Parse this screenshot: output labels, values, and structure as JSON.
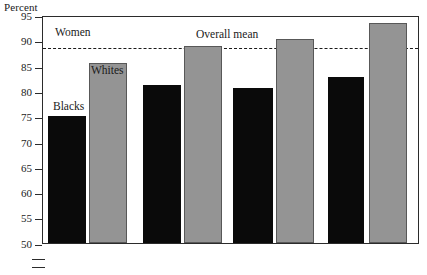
{
  "chart_data": {
    "type": "bar",
    "title": "",
    "ylabel": "Percent",
    "xlabel": "",
    "ylim": [
      50,
      95
    ],
    "ytick_values": [
      50,
      55,
      60,
      65,
      70,
      75,
      80,
      85,
      90,
      95
    ],
    "ytick_labels": [
      "50",
      "55",
      "60",
      "65",
      "70",
      "75",
      "80",
      "85",
      "90",
      "95"
    ],
    "axis_break_below": 50,
    "grid": false,
    "legend_position": "in-plot annotations",
    "categories": [
      "Group 1",
      "Group 2",
      "Group 3",
      "Group 4"
    ],
    "series": [
      {
        "name": "Blacks",
        "color": "#0a0a0a",
        "values": [
          75.3,
          81.3,
          80.7,
          83.0
        ]
      },
      {
        "name": "Whites",
        "color": "#949494",
        "values": [
          85.8,
          89.0,
          90.4,
          93.6
        ]
      }
    ],
    "annotations": [
      {
        "name": "panel-label",
        "text": "Women",
        "value": null
      },
      {
        "name": "series-label-blacks",
        "text": "Blacks",
        "value": null
      },
      {
        "name": "series-label-whites",
        "text": "Whites",
        "value": null
      },
      {
        "name": "mean-label",
        "text": "Overall mean",
        "value": 89.0
      }
    ],
    "reference_line": {
      "label": "Overall mean",
      "value": 89.0,
      "style": "dashed"
    }
  },
  "labels": {
    "axis_title": "Percent",
    "panel": "Women",
    "blacks": "Blacks",
    "whites": "Whites",
    "overall_mean": "Overall mean"
  },
  "yticks": [
    {
      "label": "95"
    },
    {
      "label": "90"
    },
    {
      "label": "85"
    },
    {
      "label": "80"
    },
    {
      "label": "75"
    },
    {
      "label": "70"
    },
    {
      "label": "65"
    },
    {
      "label": "60"
    },
    {
      "label": "55"
    },
    {
      "label": "50"
    }
  ],
  "colors": {
    "black_series": "#0a0a0a",
    "gray_series": "#949494",
    "axis": "#2b2b2b",
    "text": "#1a1a1a",
    "background": "#ffffff"
  }
}
